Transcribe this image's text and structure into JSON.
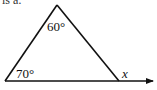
{
  "diagram": {
    "type": "geometry-triangle",
    "cut_text": "is a:",
    "vertices": {
      "apex": [
        57,
        5
      ],
      "bottom_left": [
        5,
        81
      ],
      "bottom_right": [
        119,
        81
      ]
    },
    "extension_arrow_tip": [
      155,
      81
    ],
    "angles": [
      {
        "label": "60°",
        "position": "apex",
        "x": 47,
        "y": 31
      },
      {
        "label": "70°",
        "position": "bottom-left",
        "x": 16,
        "y": 78
      },
      {
        "label": "x",
        "position": "exterior-bottom-right",
        "x": 122,
        "y": 78
      }
    ],
    "stroke_color": "#111111"
  }
}
